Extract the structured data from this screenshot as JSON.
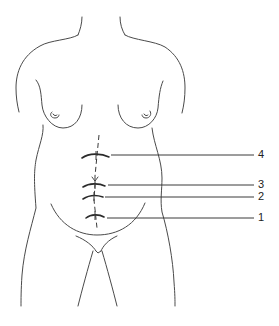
{
  "figure": {
    "type": "anatomical-line-drawing",
    "markers": [
      {
        "id": "1",
        "label": "1",
        "y": 217
      },
      {
        "id": "2",
        "label": "2",
        "y": 197
      },
      {
        "id": "3",
        "label": "3",
        "y": 185
      },
      {
        "id": "4",
        "label": "4",
        "y": 155
      }
    ],
    "colors": {
      "line": "#4a4a4a",
      "background": "#ffffff"
    }
  }
}
